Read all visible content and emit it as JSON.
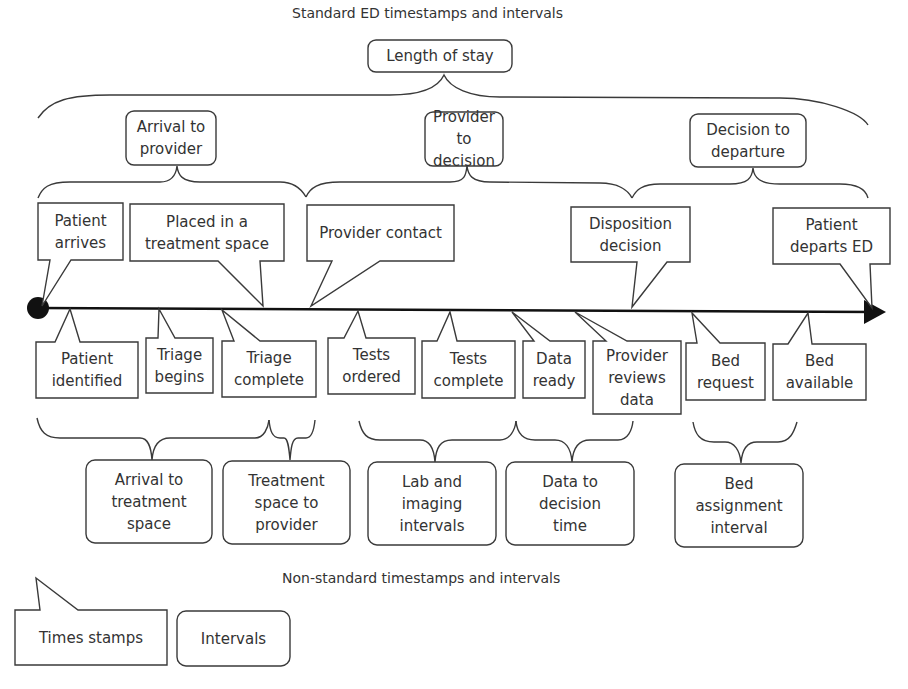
{
  "titles": {
    "standard": "Standard ED timestamps and intervals",
    "nonstandard": "Non-standard timestamps and intervals"
  },
  "top_intervals": {
    "length_of_stay": "Length of stay",
    "arrival_to_provider": "Arrival to\nprovider",
    "provider_to_decision": "Provider to\ndecision",
    "decision_to_departure": "Decision to\ndeparture"
  },
  "standard_timestamps": [
    {
      "label": "Patient\narrives"
    },
    {
      "label": "Placed in a\ntreatment space"
    },
    {
      "label": "Provider contact"
    },
    {
      "label": "Disposition\ndecision"
    },
    {
      "label": "Patient\ndeparts ED"
    }
  ],
  "nonstandard_timestamps": [
    {
      "label": "Patient\nidentified"
    },
    {
      "label": "Triage\nbegins"
    },
    {
      "label": "Triage\ncomplete"
    },
    {
      "label": "Tests\nordered"
    },
    {
      "label": "Tests\ncomplete"
    },
    {
      "label": "Data\nready"
    },
    {
      "label": "Provider\nreviews\ndata"
    },
    {
      "label": "Bed\nrequest"
    },
    {
      "label": "Bed\navailable"
    }
  ],
  "nonstandard_intervals": [
    {
      "label": "Arrival to\ntreatment\nspace"
    },
    {
      "label": "Treatment\nspace to\nprovider"
    },
    {
      "label": "Lab and\nimaging\nintervals"
    },
    {
      "label": "Data to\ndecision\ntime"
    },
    {
      "label": "Bed\nassignment\ninterval"
    }
  ],
  "legend": {
    "timestamps": "Times stamps",
    "intervals": "Intervals"
  }
}
